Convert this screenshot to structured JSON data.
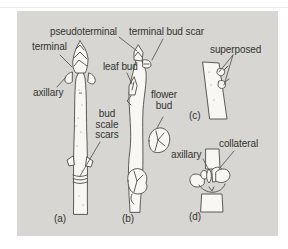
{
  "labels": {
    "pseudoterminal": "pseudoterminal",
    "terminal_bud_scar": "terminal bud scar",
    "terminal": "terminal",
    "axillary_a": "axillary",
    "leaf_bud": "leaf bud",
    "flower_bud": "flower\nbud",
    "bud_scale_scars": "bud\nscale\nscars",
    "superposed": "superposed",
    "axillary_d": "axillary",
    "collateral": "collateral"
  },
  "captions": {
    "a": "(a)",
    "b": "(b)",
    "c": "(c)",
    "d": "(d)"
  },
  "colors": {
    "panel_bg": "#d7d6d2",
    "line": "#4c4c48",
    "text": "#333331",
    "twig_fill": "#f8f7f3"
  }
}
